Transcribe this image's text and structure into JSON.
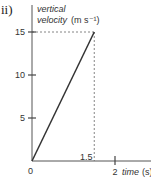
{
  "part_label": "ii)",
  "chart_data": {
    "type": "line",
    "title": "",
    "ylabel_line1": "vertical",
    "ylabel_line2": "velocity",
    "ylabel_unit": "(m s⁻¹)",
    "xlabel": "time",
    "xlabel_unit": "(s)",
    "origin_label": "0",
    "yticks": [
      5,
      10,
      15
    ],
    "ytick_labels": [
      "5",
      "10",
      "15"
    ],
    "xticks": [
      2
    ],
    "xtick_labels": [
      "2"
    ],
    "x_marker": 1.5,
    "x_marker_label": "1.5",
    "xlim": [
      0,
      2.4
    ],
    "ylim": [
      0,
      17
    ],
    "series": [
      {
        "name": "vertical velocity",
        "x": [
          0,
          1.5
        ],
        "y": [
          0,
          15
        ]
      }
    ],
    "guides": [
      {
        "type": "dashed-horizontal",
        "y": 15,
        "from_x": 0,
        "to_x": 1.5
      },
      {
        "type": "dashed-vertical",
        "x": 1.5,
        "from_y": 0,
        "to_y": 15
      }
    ],
    "grid": false
  }
}
